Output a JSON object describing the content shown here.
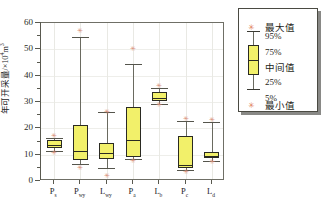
{
  "chart_data": {
    "type": "box",
    "title": "",
    "xlabel": "",
    "ylabel": "年可开采量/×10⁴m³",
    "ylabel_text": "年可开采量/×10",
    "ylabel_exponent": "4",
    "ylabel_unit": "m",
    "ylabel_unit_exponent": "3",
    "ylim": [
      0,
      60
    ],
    "yticks": [
      0,
      10,
      20,
      30,
      40,
      50,
      60
    ],
    "ytick_labels": [
      "0",
      "10",
      "20",
      "30",
      "40",
      "50",
      "60"
    ],
    "minor_tick_step": 5,
    "grid": true,
    "categories": [
      "P_s",
      "P_wy",
      "L_wy",
      "P_a",
      "L_b",
      "P_c",
      "L_d"
    ],
    "category_labels": [
      {
        "base": "P",
        "sub": "s"
      },
      {
        "base": "P",
        "sub": "wy"
      },
      {
        "base": "L",
        "sub": "wy"
      },
      {
        "base": "P",
        "sub": "a"
      },
      {
        "base": "L",
        "sub": "b"
      },
      {
        "base": "P",
        "sub": "c"
      },
      {
        "base": "L",
        "sub": "d"
      }
    ],
    "boxes": [
      {
        "name": "P_s",
        "min": 10.8,
        "p5": 11.5,
        "q1": 12.4,
        "median": 13.6,
        "q3": 15.6,
        "p95": 16.4,
        "max": 16.9
      },
      {
        "name": "P_wy",
        "min": 5.0,
        "p5": 6.6,
        "q1": 8.0,
        "median": 11.3,
        "q3": 21.2,
        "p95": 54.5,
        "max": 57.0
      },
      {
        "name": "L_wy",
        "min": 2.0,
        "p5": 5.0,
        "q1": 8.2,
        "median": 10.5,
        "q3": 14.4,
        "p95": 26.1,
        "max": 26.1
      },
      {
        "name": "P_a",
        "min": 7.6,
        "p5": 8.3,
        "q1": 9.1,
        "median": 15.4,
        "q3": 28.0,
        "p95": 44.3,
        "max": 50.2
      },
      {
        "name": "L_b",
        "min": 28.8,
        "p5": 29.2,
        "q1": 30.2,
        "median": 31.4,
        "q3": 33.8,
        "p95": 35.3,
        "max": 36.0
      },
      {
        "name": "P_c",
        "min": 3.6,
        "p5": 4.2,
        "q1": 5.0,
        "median": 6.0,
        "q3": 16.9,
        "p95": 22.9,
        "max": 23.6
      },
      {
        "name": "L_d",
        "min": 7.2,
        "p5": 7.6,
        "q1": 8.6,
        "median": 9.6,
        "q3": 10.9,
        "p95": 22.3,
        "max": 23.0
      }
    ]
  },
  "legend": {
    "items": [
      {
        "key": "max",
        "label": "最大值",
        "glyph": "star"
      },
      {
        "key": "p95",
        "label": "95%",
        "glyph": "cap"
      },
      {
        "key": "q3",
        "label": "75%",
        "glyph": "box-top"
      },
      {
        "key": "median",
        "label": "中间值",
        "glyph": "median"
      },
      {
        "key": "q1",
        "label": "25%",
        "glyph": "box-bottom"
      },
      {
        "key": "p5",
        "label": "5%",
        "glyph": "cap"
      },
      {
        "key": "min",
        "label": "最小值",
        "glyph": "star"
      }
    ]
  },
  "colors": {
    "box_fill": "#f2f06a",
    "box_stroke": "#2a2a22",
    "whisker": "#6a6a60",
    "outlier": "#d98f7a",
    "grid": "#e9e9e4",
    "frame": "#6f6f66"
  }
}
